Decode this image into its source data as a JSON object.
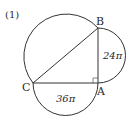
{
  "problem": {
    "number": "(1)"
  },
  "points": {
    "A": "A",
    "B": "B",
    "C": "C"
  },
  "areas": {
    "ab_semicircle": "24π",
    "ca_semicircle": "36π"
  },
  "colors": {
    "stroke": "#333333",
    "text": "#2a2a2a",
    "background": "#ffffff"
  }
}
